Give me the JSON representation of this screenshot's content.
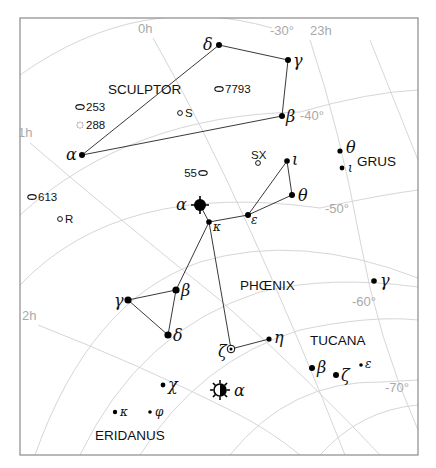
{
  "chart_data": {
    "type": "star-chart",
    "region": "Southern sky — Sculptor / Phoenix / Tucana / Grus / Eridanus",
    "grid": {
      "ra_labels": [
        {
          "text": "0h",
          "x": 138,
          "y": 33
        },
        {
          "text": "23h",
          "x": 310,
          "y": 35
        },
        {
          "text": "1h",
          "x": 18,
          "y": 137
        },
        {
          "text": "2h",
          "x": 22,
          "y": 320
        }
      ],
      "dec_labels": [
        {
          "text": "-30°",
          "x": 270,
          "y": 35
        },
        {
          "text": "-40°",
          "x": 300,
          "y": 120
        },
        {
          "text": "-50°",
          "x": 325,
          "y": 213
        },
        {
          "text": "-60°",
          "x": 352,
          "y": 306
        },
        {
          "text": "-70°",
          "x": 385,
          "y": 392
        }
      ]
    },
    "constellations": [
      {
        "name": "SCULPTOR",
        "x": 108,
        "y": 94
      },
      {
        "name": "PHŒNIX",
        "x": 240,
        "y": 290
      },
      {
        "name": "TUCANA",
        "x": 310,
        "y": 345
      },
      {
        "name": "GRUS",
        "x": 357,
        "y": 166
      },
      {
        "name": "ERIDANUS",
        "x": 95,
        "y": 440
      }
    ],
    "stars": [
      {
        "id": "scl-alpha",
        "label": "α",
        "x": 82,
        "y": 155,
        "r": 3,
        "lx": -16,
        "ly": 5
      },
      {
        "id": "scl-delta",
        "label": "δ",
        "x": 219,
        "y": 45,
        "r": 3,
        "lx": -16,
        "ly": 5
      },
      {
        "id": "scl-gamma",
        "label": "γ",
        "x": 288,
        "y": 60,
        "r": 3,
        "lx": 5,
        "ly": 6
      },
      {
        "id": "scl-beta",
        "label": "β",
        "x": 282,
        "y": 116,
        "r": 3,
        "lx": 4,
        "ly": 6
      },
      {
        "id": "phe-alpha",
        "label": "α",
        "x": 200,
        "y": 205,
        "r": 6,
        "lx": -24,
        "ly": 5,
        "type": "bright"
      },
      {
        "id": "phe-kappa",
        "label": "κ",
        "x": 209,
        "y": 222,
        "r": 2.8,
        "lx": 4,
        "ly": 9,
        "small": true
      },
      {
        "id": "phe-epsilon",
        "label": "ε",
        "x": 248,
        "y": 215,
        "r": 3,
        "lx": 3,
        "ly": 9,
        "small": true
      },
      {
        "id": "phe-theta",
        "label": "θ",
        "x": 292,
        "y": 195,
        "r": 3,
        "lx": 6,
        "ly": 6
      },
      {
        "id": "phe-iota",
        "label": "ι",
        "x": 287,
        "y": 161,
        "r": 2.8,
        "lx": 5,
        "ly": 4
      },
      {
        "id": "phe-beta",
        "label": "β",
        "x": 176,
        "y": 290,
        "r": 3.6,
        "lx": 5,
        "ly": 6
      },
      {
        "id": "phe-gamma",
        "label": "γ",
        "x": 128,
        "y": 300,
        "r": 3.6,
        "lx": -14,
        "ly": 6
      },
      {
        "id": "phe-delta",
        "label": "δ",
        "x": 168,
        "y": 335,
        "r": 3.6,
        "lx": 5,
        "ly": 6
      },
      {
        "id": "phe-zeta",
        "label": "ζ",
        "x": 231,
        "y": 349,
        "r": 3,
        "lx": -13,
        "ly": 8,
        "type": "variable"
      },
      {
        "id": "phe-eta",
        "label": "η",
        "x": 269,
        "y": 339,
        "r": 2.6,
        "lx": 5,
        "ly": 4
      },
      {
        "id": "eri-alpha",
        "label": "α",
        "x": 220,
        "y": 390,
        "r": 6,
        "lx": 14,
        "ly": 6,
        "type": "achernar"
      },
      {
        "id": "eri-chi",
        "label": "χ",
        "x": 163,
        "y": 385,
        "r": 2.4,
        "lx": 5,
        "ly": 5
      },
      {
        "id": "eri-kappa",
        "label": "κ",
        "x": 115,
        "y": 412,
        "r": 2.2,
        "lx": 5,
        "ly": 4,
        "small": true
      },
      {
        "id": "eri-phi",
        "label": "φ",
        "x": 150,
        "y": 412,
        "r": 1.8,
        "lx": 5,
        "ly": 4,
        "small": true
      },
      {
        "id": "tuc-beta",
        "label": "β",
        "x": 312,
        "y": 368,
        "r": 3,
        "lx": 5,
        "ly": 5
      },
      {
        "id": "tuc-zeta",
        "label": "ζ",
        "x": 336,
        "y": 375,
        "r": 3,
        "lx": 5,
        "ly": 6
      },
      {
        "id": "tuc-epsilon",
        "label": "ε",
        "x": 361,
        "y": 365,
        "r": 1.8,
        "lx": 4,
        "ly": 3,
        "small": true
      },
      {
        "id": "gru-theta",
        "label": "θ",
        "x": 340,
        "y": 151,
        "r": 2.6,
        "lx": 6,
        "ly": 2
      },
      {
        "id": "gru-iota",
        "label": "ι",
        "x": 342,
        "y": 168,
        "r": 2.4,
        "lx": 6,
        "ly": 4,
        "small": true
      },
      {
        "id": "gru-gamma",
        "label": "γ",
        "x": 374,
        "y": 281,
        "r": 2.8,
        "lx": 6,
        "ly": 5
      }
    ],
    "lines": [
      [
        "scl-alpha",
        "scl-beta"
      ],
      [
        "scl-beta",
        "scl-gamma"
      ],
      [
        "scl-gamma",
        "scl-delta"
      ],
      [
        "scl-delta",
        "scl-alpha"
      ],
      [
        "phe-alpha",
        "phe-kappa"
      ],
      [
        "phe-kappa",
        "phe-epsilon"
      ],
      [
        "phe-epsilon",
        "phe-theta"
      ],
      [
        "phe-theta",
        "phe-iota"
      ],
      [
        "phe-iota",
        "phe-epsilon"
      ],
      [
        "phe-kappa",
        "phe-beta"
      ],
      [
        "phe-beta",
        "phe-gamma"
      ],
      [
        "phe-gamma",
        "phe-delta"
      ],
      [
        "phe-delta",
        "phe-beta"
      ],
      [
        "phe-kappa",
        "phe-zeta"
      ],
      [
        "phe-zeta",
        "phe-eta"
      ]
    ],
    "deep_sky": [
      {
        "label": "7793",
        "x": 219,
        "y": 89,
        "shape": "galaxy",
        "label_side": "right"
      },
      {
        "label": "253",
        "x": 80,
        "y": 107,
        "shape": "galaxy",
        "label_side": "right"
      },
      {
        "label": "288",
        "x": 80,
        "y": 125,
        "shape": "cluster",
        "label_side": "right"
      },
      {
        "label": "S",
        "x": 180,
        "y": 113,
        "shape": "variable",
        "label_side": "right"
      },
      {
        "label": "SX",
        "x": 258,
        "y": 163,
        "shape": "variable",
        "label_side": "top"
      },
      {
        "label": "55",
        "x": 203,
        "y": 173,
        "shape": "galaxy",
        "label_side": "left"
      },
      {
        "label": "613",
        "x": 32,
        "y": 197,
        "shape": "galaxy",
        "label_side": "right"
      },
      {
        "label": "R",
        "x": 60,
        "y": 219,
        "shape": "variable",
        "label_side": "right"
      }
    ]
  }
}
